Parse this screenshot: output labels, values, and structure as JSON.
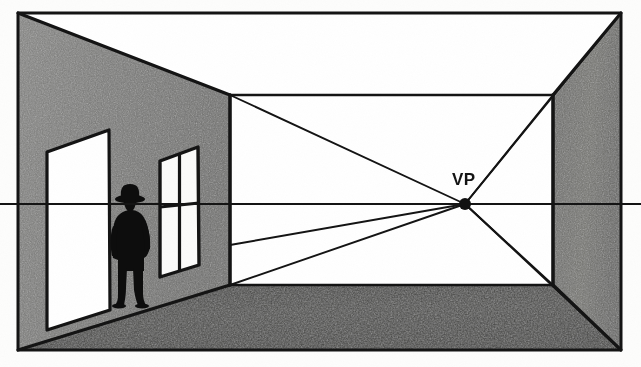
{
  "illustration": {
    "title": "One-point perspective interior room diagram",
    "labels": {
      "vanishing_point": "VP"
    },
    "colors": {
      "paper": "#fdfdfc",
      "line": "#151515",
      "left_wall": "#7b7b79",
      "right_wall": "#6f6f6d",
      "back_wall": "#ffffff",
      "floor": "#464644",
      "ceiling": "#ffffff",
      "figure": "#0d0d0d",
      "door_fill": "#ffffff",
      "window_fill": "#fbfbfa"
    },
    "geometry": {
      "frame": {
        "left": 18,
        "top": 13,
        "right": 621,
        "bottom": 350
      },
      "vanishing_point": {
        "x": 465,
        "y": 204
      },
      "horizon_y": 204,
      "back_wall": {
        "left": 230,
        "top": 95,
        "right": 553,
        "bottom": 285
      }
    },
    "elements": [
      {
        "name": "left-wall",
        "label": "Left wall"
      },
      {
        "name": "right-wall",
        "label": "Right wall"
      },
      {
        "name": "back-wall",
        "label": "Back wall"
      },
      {
        "name": "ceiling",
        "label": "Ceiling"
      },
      {
        "name": "floor",
        "label": "Floor"
      },
      {
        "name": "door",
        "label": "Door"
      },
      {
        "name": "window",
        "label": "Window"
      },
      {
        "name": "figure",
        "label": "Standing figure"
      },
      {
        "name": "horizon-line",
        "label": "Horizon / eye level line"
      },
      {
        "name": "vanishing-point-dot",
        "label": "Vanishing point"
      }
    ],
    "orthogonals": [
      {
        "from_x": 230,
        "from_y": 95
      },
      {
        "from_x": 230,
        "from_y": 285
      },
      {
        "from_x": 230,
        "from_y": 245
      },
      {
        "from_x": 553,
        "from_y": 95
      },
      {
        "from_x": 553,
        "from_y": 285
      },
      {
        "from_x": 621,
        "from_y": 13
      },
      {
        "from_x": 621,
        "from_y": 350
      },
      {
        "from_x": 18,
        "from_y": 13
      },
      {
        "from_x": 18,
        "from_y": 350
      }
    ]
  }
}
